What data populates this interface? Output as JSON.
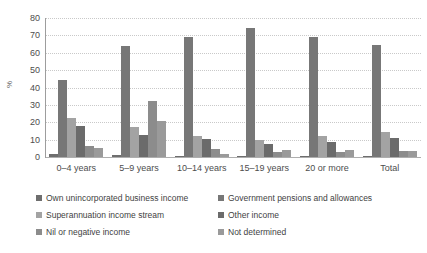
{
  "chart_data": {
    "type": "bar",
    "title": "",
    "xlabel": "",
    "ylabel": "%",
    "ylim": [
      0,
      80
    ],
    "yticks": [
      0,
      10,
      20,
      30,
      40,
      50,
      60,
      70,
      80
    ],
    "ytick_labels": [
      "0",
      "10",
      "20",
      "30",
      "40",
      "50",
      "60",
      "70",
      "80"
    ],
    "grid": true,
    "legend_position": "bottom",
    "categories": [
      "0–4 years",
      "5–9 years",
      "10–14 years",
      "15–19 years",
      "20 or more",
      "Total"
    ],
    "series": [
      {
        "name": "Own unincorporated business income",
        "color": "#6e6e6e",
        "values": [
          1.5,
          1.0,
          0.6,
          0.5,
          0.4,
          0.5
        ]
      },
      {
        "name": "Government pensions and allowances",
        "color": "#777777",
        "values": [
          44.5,
          64.0,
          69.0,
          74.5,
          69.2,
          64.5
        ]
      },
      {
        "name": "Superannuation income stream",
        "color": "#a3a3a3",
        "values": [
          22.5,
          17.0,
          12.0,
          9.6,
          12.0,
          14.2
        ]
      },
      {
        "name": "Other income",
        "color": "#6b6b6b",
        "values": [
          18.0,
          12.8,
          10.3,
          7.4,
          8.4,
          11.0
        ]
      },
      {
        "name": "Nil or negative income",
        "color": "#8c8c8c",
        "values": [
          6.5,
          32.5,
          4.5,
          3.0,
          2.8,
          3.5
        ]
      },
      {
        "name": "Not determined",
        "color": "#9a9a9a",
        "values": [
          5.0,
          20.5,
          1.8,
          3.8,
          4.3,
          3.2
        ]
      }
    ]
  }
}
